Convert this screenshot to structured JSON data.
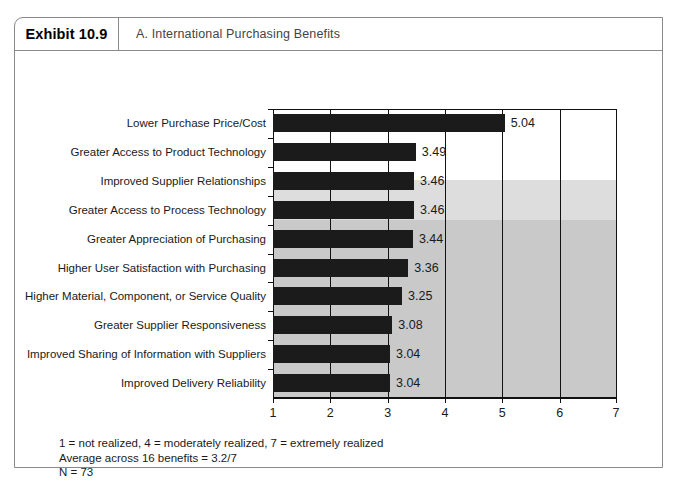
{
  "exhibit": {
    "number_label": "Exhibit 10.9",
    "subtitle": "A. International Purchasing Benefits"
  },
  "footnotes": [
    "1 = not realized, 4 = moderately realized, 7 = extremely realized",
    "Average across 16 benefits = 3.2/7",
    "N = 73"
  ],
  "colors": {
    "bar": "#1b1b1b",
    "shade_light": "#dddddd",
    "shade_dark": "#c9c9c9",
    "frame": "#8a8a8a",
    "axis": "#111111"
  },
  "chart_data": {
    "type": "bar",
    "orientation": "horizontal",
    "title": "A. International Purchasing Benefits",
    "xlabel": "",
    "ylabel": "",
    "xlim": [
      1,
      7
    ],
    "xticks": [
      1,
      2,
      3,
      4,
      5,
      6,
      7
    ],
    "xtick_labels": [
      "1",
      "2",
      "3",
      "4",
      "5",
      "6",
      "7"
    ],
    "grid": true,
    "legend": null,
    "categories": [
      "Lower Purchase Price/Cost",
      "Greater Access to Product Technology",
      "Improved Supplier Relationships",
      "Greater Access to Process Technology",
      "Greater Appreciation of Purchasing",
      "Higher User Satisfaction with Purchasing",
      "Higher Material, Component, or Service Quality",
      "Greater Supplier Responsiveness",
      "Improved Sharing of Information with Suppliers",
      "Improved Delivery Reliability"
    ],
    "values": [
      5.04,
      3.49,
      3.46,
      3.46,
      3.44,
      3.36,
      3.25,
      3.08,
      3.04,
      3.04
    ],
    "value_labels": [
      "5.04",
      "3.49",
      "3.46",
      "3.46",
      "3.44",
      "3.36",
      "3.25",
      "3.08",
      "3.04",
      "3.04"
    ],
    "annotations": [
      "1 = not realized, 4 = moderately realized, 7 = extremely realized",
      "Average across 16 benefits = 3.2/7",
      "N = 73"
    ]
  }
}
